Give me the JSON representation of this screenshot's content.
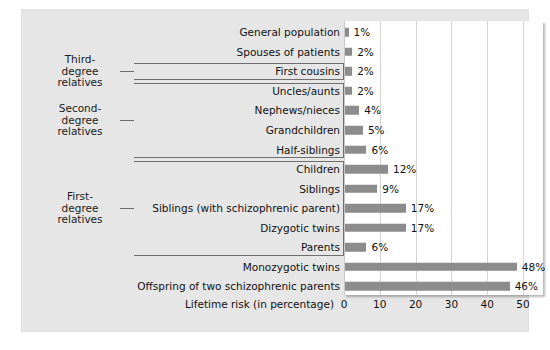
{
  "chart_data": {
    "type": "bar",
    "orientation": "horizontal",
    "title": "",
    "xlabel": "Lifetime risk (in percentage)",
    "ylabel": "",
    "xlim": [
      0,
      55
    ],
    "xticks": [
      0,
      10,
      20,
      30,
      40,
      50
    ],
    "grid": "vertical",
    "legend": "none",
    "bar_color": "#8c8c8c",
    "plot_background": "#ffffff",
    "figure_background": "#e6e6e6",
    "categories": [
      "General population",
      "Spouses of patients",
      "First cousins",
      "Uncles/aunts",
      "Nephews/nieces",
      "Grandchildren",
      "Half-siblings",
      "Children",
      "Siblings",
      "Siblings (with schizophrenic parent)",
      "Dizygotic twins",
      "Parents",
      "Monozygotic twins",
      "Offspring of two schizophrenic parents"
    ],
    "values": [
      1,
      2,
      2,
      2,
      4,
      5,
      6,
      12,
      9,
      17,
      17,
      6,
      48,
      46
    ],
    "value_labels": [
      "1%",
      "2%",
      "2%",
      "2%",
      "4%",
      "5%",
      "6%",
      "12%",
      "9%",
      "17%",
      "17%",
      "6%",
      "48%",
      "46%"
    ]
  },
  "groups": [
    {
      "label": "Third-\ndegree\nrelatives",
      "line1": "Third-",
      "line2": "degree",
      "line3": "relatives",
      "first_index": 2,
      "last_index": 2
    },
    {
      "label": "Second-\ndegree\nrelatives",
      "line1": "Second-",
      "line2": "degree",
      "line3": "relatives",
      "first_index": 3,
      "last_index": 6
    },
    {
      "label": "First-\ndegree\nrelatives",
      "line1": "First-",
      "line2": "degree",
      "line3": "relatives",
      "first_index": 7,
      "last_index": 11
    }
  ]
}
